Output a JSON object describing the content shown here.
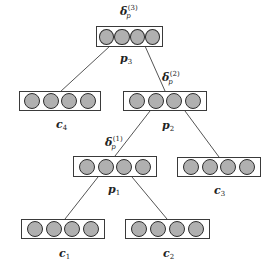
{
  "diagram": {
    "type": "binary-tree",
    "colors": {
      "neuron_fill": "#b0b0b0",
      "neuron_stroke": "#2e2e2e",
      "box_stroke": "#3a3a3a",
      "edge": "#555555"
    },
    "nodes": [
      {
        "id": "p3",
        "label": "p",
        "sub": "3",
        "neurons": 4,
        "delta": {
          "symbol": "δ",
          "sub": "p",
          "sup": "(3)"
        }
      },
      {
        "id": "c4",
        "label": "c",
        "sub": "4",
        "neurons": 4
      },
      {
        "id": "p2",
        "label": "p",
        "sub": "2",
        "neurons": 4,
        "delta": {
          "symbol": "δ",
          "sub": "p",
          "sup": "(2)"
        }
      },
      {
        "id": "p1",
        "label": "p",
        "sub": "1",
        "neurons": 4,
        "delta": {
          "symbol": "δ",
          "sub": "p",
          "sup": "(1)"
        }
      },
      {
        "id": "c3",
        "label": "c",
        "sub": "3",
        "neurons": 4
      },
      {
        "id": "c1",
        "label": "c",
        "sub": "1",
        "neurons": 4
      },
      {
        "id": "c2",
        "label": "c",
        "sub": "2",
        "neurons": 4
      }
    ],
    "edges": [
      {
        "from": "p3",
        "to": "c4"
      },
      {
        "from": "p3",
        "to": "p2"
      },
      {
        "from": "p2",
        "to": "p1"
      },
      {
        "from": "p2",
        "to": "c3"
      },
      {
        "from": "p1",
        "to": "c1"
      },
      {
        "from": "p1",
        "to": "c2"
      }
    ]
  }
}
